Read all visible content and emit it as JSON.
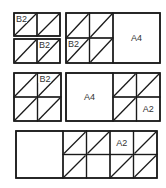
{
  "diagram": {
    "stroke_color": "#1a1a1a",
    "groups": [
      {
        "id": "row1-left",
        "x": 14,
        "y": 13,
        "w": 46,
        "h": 50,
        "split": "two-stacked",
        "cells": [
          {
            "x": 14,
            "y": 13,
            "w": 23,
            "h": 23,
            "diag": true,
            "label": "B2"
          },
          {
            "x": 37,
            "y": 13,
            "w": 23,
            "h": 23,
            "diag": true,
            "label": ""
          },
          {
            "x": 14,
            "y": 39,
            "w": 23,
            "h": 24,
            "diag": true,
            "label": ""
          },
          {
            "x": 37,
            "y": 39,
            "w": 23,
            "h": 24,
            "diag": true,
            "label": "B2"
          }
        ]
      },
      {
        "id": "row1-right",
        "x": 66,
        "y": 13,
        "w": 94,
        "h": 50,
        "big_region": {
          "x": 113,
          "y": 13,
          "w": 47,
          "h": 50,
          "label": "A4"
        },
        "cells": [
          {
            "x": 66,
            "y": 13,
            "w": 23.5,
            "h": 25,
            "diag": true,
            "label": ""
          },
          {
            "x": 89.5,
            "y": 13,
            "w": 23.5,
            "h": 25,
            "diag": true,
            "label": ""
          },
          {
            "x": 66,
            "y": 38,
            "w": 23.5,
            "h": 25,
            "diag": true,
            "label": "B2"
          },
          {
            "x": 89.5,
            "y": 38,
            "w": 23.5,
            "h": 25,
            "diag": true,
            "label": ""
          }
        ]
      },
      {
        "id": "row2-left",
        "x": 14,
        "y": 73,
        "w": 47,
        "h": 48,
        "cells": [
          {
            "x": 14,
            "y": 73,
            "w": 23.5,
            "h": 24,
            "diag": true,
            "label": ""
          },
          {
            "x": 37.5,
            "y": 73,
            "w": 23.5,
            "h": 24,
            "diag": true,
            "label": "B2"
          },
          {
            "x": 14,
            "y": 97,
            "w": 23.5,
            "h": 24,
            "diag": true,
            "label": ""
          },
          {
            "x": 37.5,
            "y": 97,
            "w": 23.5,
            "h": 24,
            "diag": true,
            "label": ""
          }
        ]
      },
      {
        "id": "row2-right",
        "x": 66,
        "y": 73,
        "w": 94,
        "h": 48,
        "big_region": {
          "x": 66,
          "y": 73,
          "w": 47,
          "h": 48,
          "label": "A4"
        },
        "cells": [
          {
            "x": 113,
            "y": 73,
            "w": 23.5,
            "h": 24,
            "diag": true,
            "label": ""
          },
          {
            "x": 136.5,
            "y": 73,
            "w": 23.5,
            "h": 24,
            "diag": true,
            "label": ""
          },
          {
            "x": 113,
            "y": 97,
            "w": 23.5,
            "h": 24,
            "diag": true,
            "label": ""
          },
          {
            "x": 136.5,
            "y": 97,
            "w": 23.5,
            "h": 24,
            "diag": false,
            "label": "A2"
          }
        ]
      },
      {
        "id": "row3",
        "x": 16,
        "y": 131,
        "w": 141,
        "h": 47,
        "big_region": {
          "x": 16,
          "y": 131,
          "w": 47,
          "h": 47,
          "label": ""
        },
        "cells": [
          {
            "x": 63,
            "y": 131,
            "w": 23.5,
            "h": 23.5,
            "diag": true,
            "label": ""
          },
          {
            "x": 86.5,
            "y": 131,
            "w": 23.5,
            "h": 23.5,
            "diag": true,
            "label": ""
          },
          {
            "x": 110,
            "y": 131,
            "w": 23.5,
            "h": 23.5,
            "diag": false,
            "label": "A2"
          },
          {
            "x": 133.5,
            "y": 131,
            "w": 23.5,
            "h": 23.5,
            "diag": true,
            "label": ""
          },
          {
            "x": 63,
            "y": 154.5,
            "w": 23.5,
            "h": 23.5,
            "diag": true,
            "label": ""
          },
          {
            "x": 86.5,
            "y": 154.5,
            "w": 23.5,
            "h": 23.5,
            "diag": false,
            "label": ""
          },
          {
            "x": 110,
            "y": 154.5,
            "w": 23.5,
            "h": 23.5,
            "diag": true,
            "label": ""
          },
          {
            "x": 133.5,
            "y": 154.5,
            "w": 23.5,
            "h": 23.5,
            "diag": true,
            "label": ""
          }
        ]
      }
    ]
  }
}
